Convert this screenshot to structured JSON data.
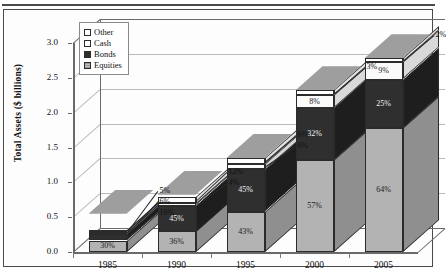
{
  "chart_data": {
    "type": "bar",
    "subtype": "stacked-column-3d",
    "title": "",
    "xlabel": "",
    "ylabel": "Total Assets ($ billions)",
    "ylim": [
      0.0,
      3.0
    ],
    "ytick_labels": [
      "0.0",
      "0.5",
      "1.0",
      "1.5",
      "2.0",
      "2.5",
      "3.0"
    ],
    "ytick_values": [
      0.0,
      0.5,
      1.0,
      1.5,
      2.0,
      2.5,
      3.0
    ],
    "grid": true,
    "legend_position": "top-left-inside",
    "categories": [
      "1985",
      "1990",
      "1995",
      "2000",
      "2005"
    ],
    "totals": [
      0.55,
      0.82,
      1.35,
      2.32,
      2.78
    ],
    "series": [
      {
        "name": "Equities",
        "color": "#b3b3b3",
        "values": [
          30,
          36,
          43,
          57,
          64
        ],
        "labels": [
          "30%",
          "36%",
          "43%",
          "57%",
          "64%"
        ]
      },
      {
        "name": "Bonds",
        "color": "#2f2f2f",
        "values": [
          16,
          45,
          45,
          32,
          25
        ],
        "labels": [
          "16%",
          "45%",
          "45%",
          "32%",
          "25%"
        ]
      },
      {
        "name": "Cash",
        "color": "#fafafa",
        "values": [
          6,
          4,
          6,
          8,
          9
        ],
        "labels": [
          "6%",
          "4%",
          "6%",
          "8%",
          "9%"
        ]
      },
      {
        "name": "Other",
        "color": "#ffffff",
        "values": [
          5,
          12,
          6,
          3,
          2
        ],
        "labels": [
          "5%",
          "12%",
          "6%",
          "3%",
          "2%"
        ]
      }
    ],
    "units": "percent of total assets",
    "annotations": [
      {
        "year": "1985",
        "series": "Other",
        "text": "5%"
      },
      {
        "year": "1985",
        "series": "Cash",
        "text": "6%"
      },
      {
        "year": "1990",
        "series": "Other",
        "text": "12%"
      },
      {
        "year": "1990",
        "series": "Cash",
        "text": "4%"
      },
      {
        "year": "1995",
        "series": "Other",
        "text": "6%"
      },
      {
        "year": "1995",
        "series": "Cash",
        "text": "6%"
      },
      {
        "year": "2000",
        "series": "Other",
        "text": "3%"
      },
      {
        "year": "2005",
        "series": "Other",
        "text": "2%"
      }
    ]
  },
  "legend": {
    "items": [
      {
        "label": "Other",
        "swatch": "other-swatch"
      },
      {
        "label": "Cash",
        "swatch": "cash-swatch"
      },
      {
        "label": "Bonds",
        "swatch": "bonds-swatch"
      },
      {
        "label": "Equities",
        "swatch": "equities-swatch"
      }
    ]
  },
  "axes": {
    "y_title": "Total Assets ($ billions)"
  }
}
